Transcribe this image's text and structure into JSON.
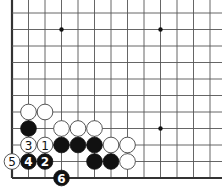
{
  "board": {
    "width": 222,
    "height": 188,
    "origin_x": 12,
    "origin_y": 178,
    "spacing": 16.5,
    "columns": 13,
    "rows": 11,
    "left_edge": true,
    "bottom_edge": true,
    "colors": {
      "background": "#ffffff",
      "grid": "#555555",
      "edge": "#333333",
      "black_stone": "#111111",
      "white_stone": "#ffffff"
    }
  },
  "star_points": [
    {
      "col": 3,
      "row": 9
    },
    {
      "col": 9,
      "row": 9
    },
    {
      "col": 9,
      "row": 3
    }
  ],
  "stones": [
    {
      "color": "white",
      "col": 1,
      "row": 4,
      "label": ""
    },
    {
      "color": "white",
      "col": 2,
      "row": 4,
      "label": ""
    },
    {
      "color": "black",
      "col": 1,
      "row": 3,
      "label": ""
    },
    {
      "color": "white",
      "col": 3,
      "row": 3,
      "label": ""
    },
    {
      "color": "white",
      "col": 4,
      "row": 3,
      "label": ""
    },
    {
      "color": "white",
      "col": 5,
      "row": 3,
      "label": ""
    },
    {
      "color": "white",
      "col": 1,
      "row": 2,
      "label": "3"
    },
    {
      "color": "white",
      "col": 2,
      "row": 2,
      "label": "1"
    },
    {
      "color": "black",
      "col": 3,
      "row": 2,
      "label": ""
    },
    {
      "color": "black",
      "col": 4,
      "row": 2,
      "label": ""
    },
    {
      "color": "black",
      "col": 5,
      "row": 2,
      "label": ""
    },
    {
      "color": "white",
      "col": 6,
      "row": 2,
      "label": ""
    },
    {
      "color": "white",
      "col": 7,
      "row": 2,
      "label": ""
    },
    {
      "color": "white",
      "col": 0,
      "row": 1,
      "label": "5"
    },
    {
      "color": "black",
      "col": 1,
      "row": 1,
      "label": "4"
    },
    {
      "color": "black",
      "col": 2,
      "row": 1,
      "label": "2"
    },
    {
      "color": "black",
      "col": 5,
      "row": 1,
      "label": ""
    },
    {
      "color": "black",
      "col": 6,
      "row": 1,
      "label": ""
    },
    {
      "color": "white",
      "col": 7,
      "row": 1,
      "label": ""
    },
    {
      "color": "black",
      "col": 3,
      "row": 0,
      "label": "6"
    }
  ]
}
